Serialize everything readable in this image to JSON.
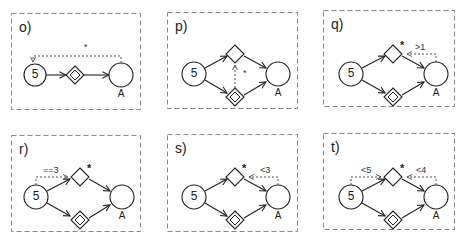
{
  "figure": {
    "panels": [
      {
        "id": "o",
        "label": "o)",
        "start_label": "5",
        "end_label": "A",
        "annotation": "*",
        "layout": "linear",
        "description": "start event 5 -> parallel gateway -> end A, dotted loop from A back to 5"
      },
      {
        "id": "p",
        "label": "p)",
        "start_label": "5",
        "end_label": "A",
        "annotation": "*",
        "layout": "branch",
        "description": "split to exclusive gateway and parallel gateway, dotted link from parallel to exclusive"
      },
      {
        "id": "q",
        "label": "q)",
        "start_label": "5",
        "end_label": "A",
        "star": "*",
        "condition_right": ">1",
        "layout": "branch"
      },
      {
        "id": "r",
        "label": "r)",
        "start_label": "5",
        "end_label": "A",
        "star": "*",
        "condition_left": "==3",
        "layout": "branch"
      },
      {
        "id": "s",
        "label": "s)",
        "start_label": "5",
        "end_label": "A",
        "star": "*",
        "condition_right": "<3",
        "layout": "branch"
      },
      {
        "id": "t",
        "label": "t)",
        "start_label": "5",
        "end_label": "A",
        "star": "*",
        "condition_left": "<5",
        "condition_right": "<4",
        "layout": "branch"
      }
    ],
    "colors": {
      "stroke": "#222222",
      "box_border": "#888888",
      "dotted": "#555555"
    }
  }
}
